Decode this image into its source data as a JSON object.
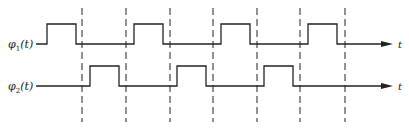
{
  "diagram": {
    "signals": [
      {
        "name": "phi1",
        "label_symbol": "φ",
        "label_subscript": "1",
        "label_suffix": "(t)",
        "axis_label": "t",
        "y_low": 44,
        "y_high": 24,
        "x_start": 36,
        "x_end": 393,
        "pulses": [
          [
            47,
            76
          ],
          [
            134,
            163
          ],
          [
            221,
            250
          ],
          [
            308,
            337
          ]
        ]
      },
      {
        "name": "phi2",
        "label_symbol": "φ",
        "label_subscript": "2",
        "label_suffix": "(t)",
        "axis_label": "t",
        "y_low": 86,
        "y_high": 66,
        "x_start": 36,
        "x_end": 393,
        "pulses": [
          [
            90,
            119
          ],
          [
            177,
            206
          ],
          [
            264,
            293
          ]
        ]
      }
    ],
    "dashed_lines_x": [
      82,
      126,
      170,
      213,
      257,
      300,
      345
    ],
    "dashed_y_range": [
      8,
      122
    ],
    "colors": {
      "line": "#222222",
      "background": "#ffffff"
    }
  }
}
